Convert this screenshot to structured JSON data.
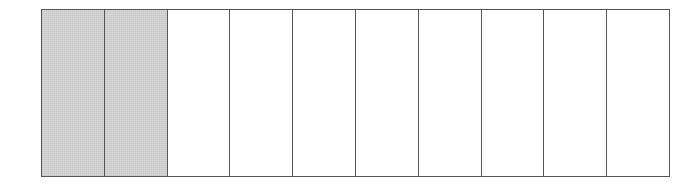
{
  "diagram": {
    "type": "fraction-bar",
    "total_parts": 10,
    "shaded_parts": 2,
    "fraction": "2/10",
    "colors": {
      "shaded": "#d8d8d8",
      "unshaded": "#ffffff",
      "border": "#555555"
    },
    "cells": [
      {
        "index": 1,
        "shaded": true
      },
      {
        "index": 2,
        "shaded": true
      },
      {
        "index": 3,
        "shaded": false
      },
      {
        "index": 4,
        "shaded": false
      },
      {
        "index": 5,
        "shaded": false
      },
      {
        "index": 6,
        "shaded": false
      },
      {
        "index": 7,
        "shaded": false
      },
      {
        "index": 8,
        "shaded": false
      },
      {
        "index": 9,
        "shaded": false
      },
      {
        "index": 10,
        "shaded": false
      }
    ]
  }
}
